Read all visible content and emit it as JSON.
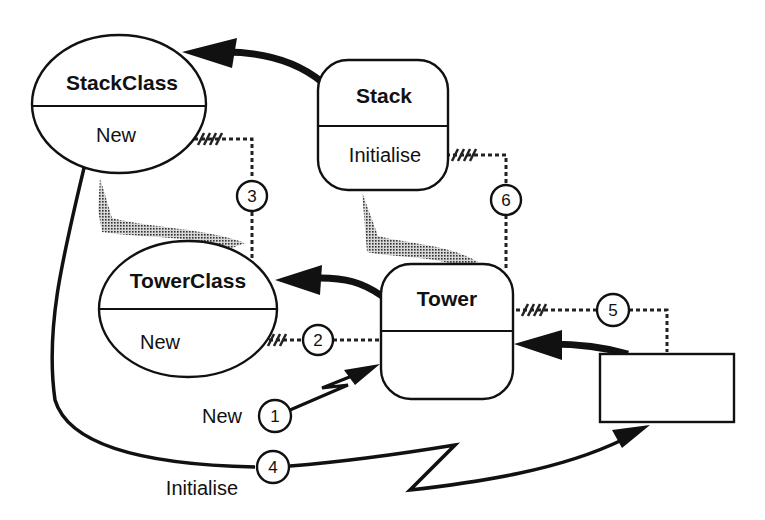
{
  "diagram": {
    "nodes": {
      "stack_class": {
        "title": "StackClass",
        "method": "New",
        "shape": "ellipse"
      },
      "stack": {
        "title": "Stack",
        "method": "Initialise",
        "shape": "rounded-rect"
      },
      "tower_class": {
        "title": "TowerClass",
        "method": "New",
        "shape": "ellipse"
      },
      "tower": {
        "title": "Tower",
        "method": "",
        "shape": "rounded-rect"
      },
      "client": {
        "title": "",
        "shape": "rect"
      }
    },
    "labels": {
      "new": "New",
      "initialise": "Initialise"
    },
    "steps": [
      "1",
      "2",
      "3",
      "4",
      "5",
      "6"
    ],
    "colors": {
      "stroke": "#111111",
      "inherit_fill": "#8c8c8c",
      "background": "#ffffff"
    }
  }
}
